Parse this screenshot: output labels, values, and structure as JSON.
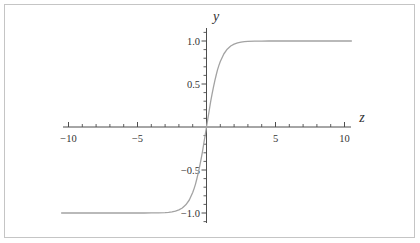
{
  "style": {
    "background": "#ffffff",
    "frame_border_color": "#c5c5c5",
    "axis_color": "#4d4d4d",
    "label_color": "#333333"
  },
  "chart_data": {
    "type": "line",
    "title": "",
    "xlabel": "z",
    "ylabel": "y",
    "xlim": [
      -10.5,
      10.5
    ],
    "ylim": [
      -1.13,
      1.15
    ],
    "grid": false,
    "legend": null,
    "x_axis": {
      "major_ticks": [
        {
          "value": -10,
          "label": "−10"
        },
        {
          "value": -5,
          "label": "−5"
        },
        {
          "value": 5,
          "label": "5"
        },
        {
          "value": 10,
          "label": "10"
        }
      ],
      "minor_step": 1,
      "minor_range": [
        -10,
        10
      ]
    },
    "y_axis": {
      "major_ticks": [
        {
          "value": 1.0,
          "label": "1.0"
        },
        {
          "value": 0.5,
          "label": "0.5"
        },
        {
          "value": -0.5,
          "label": "−0.5"
        },
        {
          "value": -1.0,
          "label": "−1.0"
        }
      ],
      "minor_step": 0.1,
      "minor_range": [
        -1.1,
        1.1
      ]
    },
    "series": [
      {
        "name": "y = tanh(z)",
        "color": "#a3a3a3",
        "points": [
          [
            -10.5,
            -1
          ],
          [
            -9,
            -1
          ],
          [
            -8,
            -1
          ],
          [
            -7,
            -1
          ],
          [
            -6,
            -1
          ],
          [
            -5,
            -0.9999
          ],
          [
            -4.5,
            -0.9998
          ],
          [
            -4,
            -0.9993
          ],
          [
            -3.5,
            -0.9982
          ],
          [
            -3,
            -0.9951
          ],
          [
            -2.75,
            -0.9919
          ],
          [
            -2.5,
            -0.9866
          ],
          [
            -2.25,
            -0.978
          ],
          [
            -2,
            -0.964
          ],
          [
            -1.75,
            -0.9414
          ],
          [
            -1.5,
            -0.9051
          ],
          [
            -1.25,
            -0.8483
          ],
          [
            -1,
            -0.7616
          ],
          [
            -0.9,
            -0.7163
          ],
          [
            -0.8,
            -0.664
          ],
          [
            -0.7,
            -0.6044
          ],
          [
            -0.6,
            -0.537
          ],
          [
            -0.5,
            -0.4621
          ],
          [
            -0.4,
            -0.3799
          ],
          [
            -0.3,
            -0.2913
          ],
          [
            -0.2,
            -0.1974
          ],
          [
            -0.1,
            -0.0997
          ],
          [
            0,
            0
          ],
          [
            0.1,
            0.0997
          ],
          [
            0.2,
            0.1974
          ],
          [
            0.3,
            0.2913
          ],
          [
            0.4,
            0.3799
          ],
          [
            0.5,
            0.4621
          ],
          [
            0.6,
            0.537
          ],
          [
            0.7,
            0.6044
          ],
          [
            0.8,
            0.664
          ],
          [
            0.9,
            0.7163
          ],
          [
            1,
            0.7616
          ],
          [
            1.25,
            0.8483
          ],
          [
            1.5,
            0.9051
          ],
          [
            1.75,
            0.9414
          ],
          [
            2,
            0.964
          ],
          [
            2.25,
            0.978
          ],
          [
            2.5,
            0.9866
          ],
          [
            2.75,
            0.9919
          ],
          [
            3,
            0.9951
          ],
          [
            3.5,
            0.9982
          ],
          [
            4,
            0.9993
          ],
          [
            4.5,
            0.9998
          ],
          [
            5,
            0.9999
          ],
          [
            6,
            1
          ],
          [
            7,
            1
          ],
          [
            8,
            1
          ],
          [
            9,
            1
          ],
          [
            10.5,
            1
          ]
        ]
      }
    ]
  }
}
